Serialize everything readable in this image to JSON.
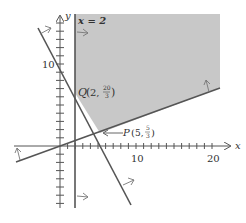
{
  "figure": {
    "axes": {
      "x_label": "x",
      "y_label": "y",
      "x_ticks_labeled": [
        "10",
        "20"
      ],
      "y_ticks_labeled": [
        "10"
      ]
    },
    "boundary_labels": {
      "vertical_line": "x = 2"
    },
    "points": {
      "Q": {
        "name": "Q",
        "coords": "(2, 20/3)",
        "x_text": "2,",
        "y_num": "20",
        "y_den": "3"
      },
      "P": {
        "name": "P",
        "coords": "(5, 5/3)",
        "x_text": "5,",
        "y_num": "5",
        "y_den": "3"
      }
    },
    "colors": {
      "feasible_region": "#c8c8c8",
      "lines": "#555555",
      "axes": "#555555"
    }
  }
}
